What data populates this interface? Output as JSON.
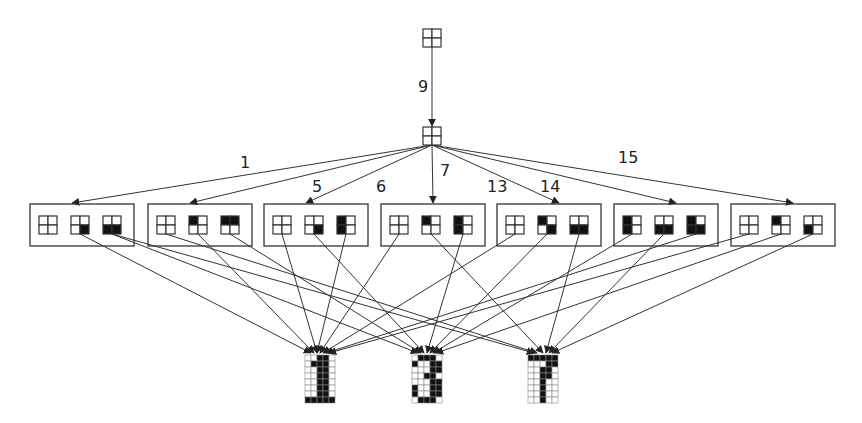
{
  "diagram": {
    "type": "hierarchical-pattern-tree",
    "root": {
      "pattern": [
        0,
        0,
        0,
        0
      ],
      "x": 432,
      "y": 38
    },
    "root_edge_label": "9",
    "hub": {
      "pattern": [
        0,
        0,
        0,
        0
      ],
      "x": 432,
      "y": 136
    },
    "hub_edge_labels": [
      {
        "text": "1",
        "x": 240,
        "y": 168
      },
      {
        "text": "5",
        "x": 312,
        "y": 192
      },
      {
        "text": "6",
        "x": 376,
        "y": 192
      },
      {
        "text": "7",
        "x": 440,
        "y": 176
      },
      {
        "text": "13",
        "x": 487,
        "y": 192
      },
      {
        "text": "14",
        "x": 540,
        "y": 192
      },
      {
        "text": "15",
        "x": 618,
        "y": 163
      }
    ],
    "groups": [
      {
        "x": 30,
        "patterns": [
          [
            0,
            0,
            0,
            0
          ],
          [
            0,
            0,
            0,
            1
          ],
          [
            0,
            0,
            1,
            1
          ]
        ]
      },
      {
        "x": 148,
        "patterns": [
          [
            0,
            0,
            0,
            0
          ],
          [
            1,
            0,
            0,
            0
          ],
          [
            1,
            1,
            0,
            0
          ]
        ]
      },
      {
        "x": 264,
        "patterns": [
          [
            0,
            0,
            0,
            0
          ],
          [
            0,
            0,
            0,
            1
          ],
          [
            1,
            0,
            1,
            0
          ]
        ]
      },
      {
        "x": 381,
        "patterns": [
          [
            0,
            0,
            0,
            0
          ],
          [
            1,
            0,
            0,
            0
          ],
          [
            1,
            0,
            1,
            0
          ]
        ]
      },
      {
        "x": 497,
        "patterns": [
          [
            0,
            0,
            0,
            0
          ],
          [
            1,
            0,
            0,
            1
          ],
          [
            0,
            0,
            1,
            1
          ]
        ]
      },
      {
        "x": 614,
        "patterns": [
          [
            1,
            0,
            1,
            0
          ],
          [
            0,
            0,
            1,
            1
          ],
          [
            1,
            0,
            1,
            1
          ]
        ]
      },
      {
        "x": 731,
        "patterns": [
          [
            0,
            0,
            0,
            0
          ],
          [
            1,
            0,
            0,
            0
          ],
          [
            0,
            0,
            1,
            0
          ]
        ]
      }
    ],
    "outputs": [
      {
        "label": "1",
        "x": 305,
        "y": 355,
        "grid": [
          "00110",
          "01110",
          "00110",
          "00110",
          "00110",
          "00110",
          "00110",
          "11111"
        ]
      },
      {
        "label": "3",
        "x": 412,
        "y": 355,
        "grid": [
          "01110",
          "10011",
          "00011",
          "00110",
          "00011",
          "10011",
          "10011",
          "01110"
        ]
      },
      {
        "label": "7",
        "x": 528,
        "y": 355,
        "grid": [
          "11111",
          "00011",
          "00110",
          "00110",
          "00100",
          "00100",
          "00100",
          "00100"
        ]
      }
    ],
    "colors": {
      "stroke": "#333333",
      "fill": "#111111",
      "grid": "#888888"
    }
  }
}
